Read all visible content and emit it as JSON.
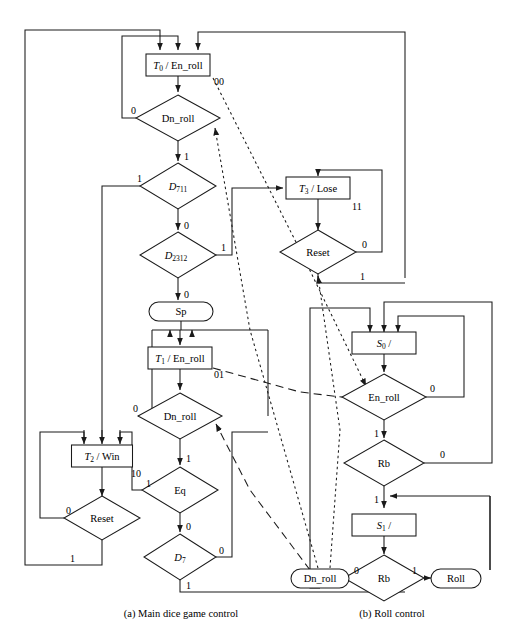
{
  "figure": {
    "captions": [
      {
        "id": "caption-a",
        "text": "(a) Main dice game control",
        "x": 181,
        "y": 614
      },
      {
        "id": "caption-b",
        "text": "(b) Roll control",
        "x": 392,
        "y": 614
      }
    ]
  },
  "colors": {
    "stroke": "#1a1a1a",
    "fill": "#ffffff",
    "text": "#000000"
  },
  "charts": {
    "main": {
      "name": "Main dice game control",
      "states": [
        {
          "id": "T0",
          "label": "T0 / En_roll",
          "italic": "T",
          "sub": "0",
          "rest": " / En_roll",
          "code": "00",
          "x": 178,
          "y": 65,
          "w": 64,
          "h": 22
        },
        {
          "id": "T1",
          "label": "T1 / En_roll",
          "italic": "T",
          "sub": "1",
          "rest": " / En_roll",
          "code": "01",
          "x": 180,
          "y": 358,
          "w": 64,
          "h": 22
        },
        {
          "id": "T2",
          "label": "T2 / Win",
          "italic": "T",
          "sub": "2",
          "rest": " / Win",
          "code": "10",
          "x": 102,
          "y": 456,
          "w": 61,
          "h": 22
        },
        {
          "id": "T3",
          "label": "T3 / Lose",
          "italic": "T",
          "sub": "3",
          "rest": " / Lose",
          "code": "11",
          "x": 318,
          "y": 188,
          "w": 64,
          "h": 22
        }
      ],
      "decisions": [
        {
          "id": "dn_roll_1",
          "label": "Dn_roll",
          "x": 178,
          "y": 118,
          "rx": 42,
          "ry": 23
        },
        {
          "id": "d711",
          "label": "D711",
          "italic": "D",
          "sub": "711",
          "x": 178,
          "y": 186,
          "rx": 38,
          "ry": 23
        },
        {
          "id": "d2312",
          "label": "D2312",
          "italic": "D",
          "sub": "2312",
          "x": 178,
          "y": 255,
          "rx": 38,
          "ry": 23
        },
        {
          "id": "dn_roll_2",
          "label": "Dn_roll",
          "x": 180,
          "y": 416,
          "rx": 42,
          "ry": 23
        },
        {
          "id": "eq",
          "label": "Eq",
          "x": 180,
          "y": 490,
          "rx": 38,
          "ry": 23
        },
        {
          "id": "d7",
          "label": "D7",
          "italic": "D",
          "sub": "7",
          "x": 180,
          "y": 557,
          "rx": 36,
          "ry": 23
        },
        {
          "id": "reset_main",
          "label": "Reset",
          "x": 102,
          "y": 518,
          "rx": 38,
          "ry": 22
        },
        {
          "id": "reset_lose",
          "label": "Reset",
          "x": 318,
          "y": 252,
          "rx": 38,
          "ry": 22
        }
      ],
      "outputs": [
        {
          "id": "sp",
          "label": "Sp",
          "x": 181,
          "y": 311,
          "w": 64,
          "h": 19
        }
      ],
      "edge_labels": [
        {
          "text": "00",
          "x": 214,
          "y": 85
        },
        {
          "text": "0",
          "x": 134,
          "y": 112
        },
        {
          "text": "1",
          "x": 184,
          "y": 162
        },
        {
          "text": "1",
          "x": 138,
          "y": 181
        },
        {
          "text": "0",
          "x": 184,
          "y": 231
        },
        {
          "text": "1",
          "x": 222,
          "y": 250
        },
        {
          "text": "0",
          "x": 184,
          "y": 300
        },
        {
          "text": "01",
          "x": 216,
          "y": 378
        },
        {
          "text": "0",
          "x": 138,
          "y": 410
        },
        {
          "text": "1",
          "x": 186,
          "y": 464
        },
        {
          "text": "1",
          "x": 148,
          "y": 484
        },
        {
          "text": "0",
          "x": 186,
          "y": 532
        },
        {
          "text": "0",
          "x": 218,
          "y": 552
        },
        {
          "text": "1",
          "x": 186,
          "y": 598
        },
        {
          "text": "10",
          "x": 137,
          "y": 476
        },
        {
          "text": "0",
          "x": 72,
          "y": 512
        },
        {
          "text": "1",
          "x": 72,
          "y": 562
        },
        {
          "text": "11",
          "x": 352,
          "y": 208
        },
        {
          "text": "0",
          "x": 357,
          "y": 245
        },
        {
          "text": "1",
          "x": 357,
          "y": 276
        }
      ]
    },
    "roll": {
      "name": "Roll control",
      "states": [
        {
          "id": "S0",
          "label": "S0 /",
          "italic": "S",
          "sub": "0",
          "rest": " /",
          "x": 384,
          "y": 343,
          "w": 64,
          "h": 22
        },
        {
          "id": "S1",
          "label": "S1 /",
          "italic": "S",
          "sub": "1",
          "rest": " /",
          "x": 384,
          "y": 525,
          "w": 64,
          "h": 22
        }
      ],
      "decisions": [
        {
          "id": "en_roll",
          "label": "En_roll",
          "x": 384,
          "y": 397,
          "rx": 42,
          "ry": 23
        },
        {
          "id": "rb_1",
          "label": "Rb",
          "x": 384,
          "y": 463,
          "rx": 40,
          "ry": 23
        },
        {
          "id": "rb_2",
          "label": "Rb",
          "x": 384,
          "y": 578,
          "rx": 40,
          "ry": 23
        }
      ],
      "outputs": [
        {
          "id": "dn_roll_out",
          "label": "Dn_roll",
          "x": 320,
          "y": 578,
          "w": 58,
          "h": 19
        },
        {
          "id": "roll_out",
          "label": "Roll",
          "x": 456,
          "y": 578,
          "w": 50,
          "h": 19
        }
      ],
      "edge_labels": [
        {
          "text": "0",
          "x": 428,
          "y": 390
        },
        {
          "text": "1",
          "x": 376,
          "y": 437
        },
        {
          "text": "0",
          "x": 436,
          "y": 455
        },
        {
          "text": "1",
          "x": 376,
          "y": 500
        },
        {
          "text": "0",
          "x": 352,
          "y": 572
        },
        {
          "text": "1",
          "x": 414,
          "y": 572
        }
      ]
    }
  },
  "link_styles": {
    "solid": "solid",
    "dashed": "dashed - long dashes, inter-chart signal",
    "dotted": "dotted - short dashes, inter-chart signal"
  }
}
